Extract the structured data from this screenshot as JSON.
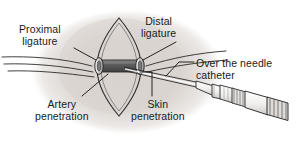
{
  "figure": {
    "background_color": "#ffffff",
    "border_color": "#9a9a9a",
    "ink_color": "#1a1a1a",
    "tissue_shadow_color": "#ddd8d4",
    "vessel_fill_color": "#6e6e6e",
    "ligature_fill_color": "#c9c9c9",
    "device_fill_color": "#f2f2f2"
  },
  "labels": {
    "proximal_ligature": "Proximal\nligature",
    "proximal_ligature_line1": "Proximal",
    "proximal_ligature_line2": "ligature",
    "distal_ligature_line1": "Distal",
    "distal_ligature_line2": "ligature",
    "over_the_needle_line1": "Over the needle",
    "over_the_needle_line2": "catheter",
    "artery_penetration_line1": "Artery",
    "artery_penetration_line2": "penetration",
    "skin_penetration_line1": "Skin",
    "skin_penetration_line2": "penetration"
  },
  "parts": {
    "vessel": "artery",
    "opening": "surgical-skin-incision",
    "device": "over-the-needle-catheter",
    "ligature_count": 2
  }
}
